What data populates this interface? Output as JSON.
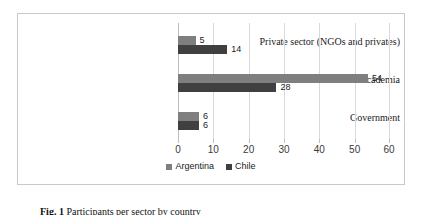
{
  "chart_data": {
    "type": "bar",
    "orientation": "horizontal",
    "title": "",
    "xlabel": "",
    "ylabel": "",
    "categories": [
      "Private sector (NGOs and privates)",
      "Academia",
      "Government"
    ],
    "series": [
      {
        "name": "Argentina",
        "color": "#7f7f7f",
        "values": [
          5,
          54,
          6
        ]
      },
      {
        "name": "Chile",
        "color": "#404040",
        "values": [
          14,
          28,
          6
        ]
      }
    ],
    "xlim": [
      0,
      60
    ],
    "xticks": [
      0,
      10,
      20,
      30,
      40,
      50,
      60
    ],
    "xtick_labels": [
      "0",
      "10",
      "20",
      "30",
      "40",
      "50",
      "60"
    ],
    "grid": "vertical",
    "legend_position": "bottom-center",
    "data_labels": [
      {
        "category": "Private sector (NGOs and privates)",
        "series": "Argentina",
        "value": "5"
      },
      {
        "category": "Private sector (NGOs and privates)",
        "series": "Chile",
        "value": "14"
      },
      {
        "category": "Academia",
        "series": "Argentina",
        "value": "54"
      },
      {
        "category": "Academia",
        "series": "Chile",
        "value": "28"
      },
      {
        "category": "Government",
        "series": "Argentina",
        "value": "6"
      },
      {
        "category": "Government",
        "series": "Chile",
        "value": "6"
      }
    ]
  },
  "caption": {
    "label": "Fig. 1",
    "text": "Participants per sector by country"
  }
}
